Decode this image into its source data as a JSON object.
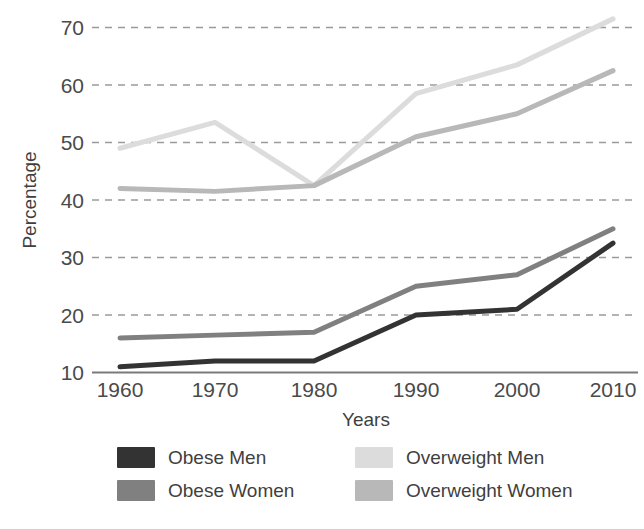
{
  "chart_data": {
    "type": "line",
    "title": "",
    "xlabel": "Years",
    "ylabel": "Percentage",
    "categories": [
      "1960",
      "1970",
      "1980",
      "1990",
      "2000",
      "2010"
    ],
    "x": [
      1960,
      1970,
      1980,
      1990,
      2000,
      2010
    ],
    "xlim": [
      1960,
      2010
    ],
    "ylim": [
      10,
      73
    ],
    "ytick_labels": [
      "10",
      "20",
      "30",
      "40",
      "50",
      "60",
      "70"
    ],
    "yticks": [
      10,
      20,
      30,
      40,
      50,
      60,
      70
    ],
    "xtick_labels": [
      "1960",
      "1970",
      "1980",
      "1990",
      "2000",
      "2010"
    ],
    "grid": "horizontal-dashed",
    "legend_position": "bottom",
    "series": [
      {
        "name": "Obese Men",
        "color": "#333333",
        "values": [
          11,
          12,
          12,
          20,
          21,
          32.5
        ]
      },
      {
        "name": "Obese Women",
        "color": "#808080",
        "values": [
          16,
          16.5,
          17,
          25,
          27,
          35
        ]
      },
      {
        "name": "Overweight Men",
        "color": "#dcdcdc",
        "values": [
          49,
          53.5,
          42.5,
          58.5,
          63.5,
          71.5
        ]
      },
      {
        "name": "Overweight Women",
        "color": "#b8b8b8",
        "values": [
          42,
          41.5,
          42.5,
          51,
          55,
          62.5
        ]
      }
    ]
  },
  "axes": {
    "y_title": "Percentage",
    "x_title": "Years",
    "axis_line_color": "#7a7a7a",
    "gridline_color": "#9a9a9a"
  },
  "legend": {
    "entries": [
      {
        "label": "Obese Men",
        "color": "#333333"
      },
      {
        "label": "Overweight Men",
        "color": "#dcdcdc"
      },
      {
        "label": "Obese Women",
        "color": "#808080"
      },
      {
        "label": "Overweight Women",
        "color": "#b8b8b8"
      }
    ]
  }
}
